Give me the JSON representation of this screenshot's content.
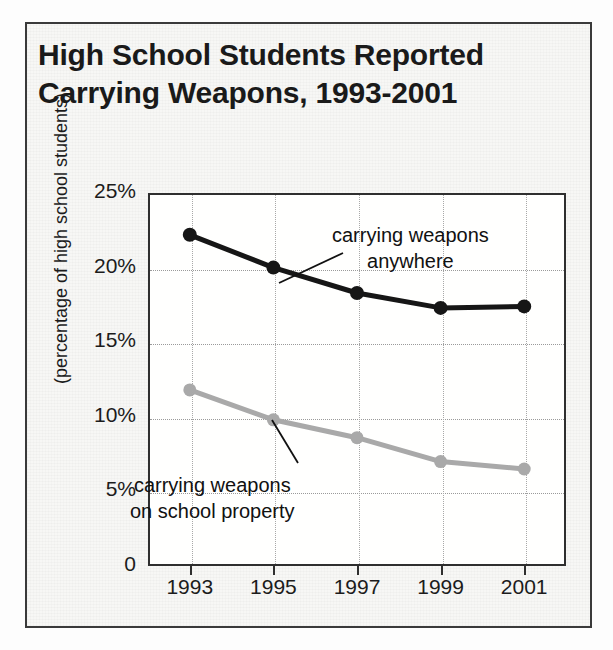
{
  "figure": {
    "title_lines": [
      "High School Students Reported",
      "Carrying Weapons, 1993-2001"
    ],
    "frame_color": "#3a3a3a",
    "background_color": "#f7f7f5"
  },
  "chart_data": {
    "type": "line",
    "title": "High School Students Reported Carrying Weapons, 1993-2001",
    "xlabel": "",
    "ylabel": "(percentage of high school students)",
    "categories": [
      "1993",
      "1995",
      "1997",
      "1999",
      "2001"
    ],
    "x": [
      1993,
      1995,
      1997,
      1999,
      2001
    ],
    "xlim": [
      1992,
      2002
    ],
    "ylim": [
      0,
      25
    ],
    "ytick_labels": [
      "0",
      "5%",
      "10%",
      "15%",
      "20%",
      "25%"
    ],
    "ytick_values": [
      0,
      5,
      10,
      15,
      20,
      25
    ],
    "xtick_labels": [
      "1993",
      "1995",
      "1997",
      "1999",
      "2001"
    ],
    "grid": true,
    "legend": "annotations",
    "series": [
      {
        "name": "carrying weapons anywhere",
        "color": "#161616",
        "marker": "circle",
        "values": [
          22.2,
          20.0,
          18.3,
          17.3,
          17.4
        ]
      },
      {
        "name": "carrying weapons on school property",
        "color": "#a9a9a9",
        "marker": "circle",
        "values": [
          11.8,
          9.8,
          8.6,
          7.0,
          6.5
        ]
      }
    ],
    "annotations": [
      {
        "id": "anywhere",
        "lines": [
          "carrying weapons",
          "anywhere"
        ],
        "target_series": 0
      },
      {
        "id": "school",
        "lines": [
          "carrying weapons",
          "on school property"
        ],
        "target_series": 1
      }
    ]
  }
}
